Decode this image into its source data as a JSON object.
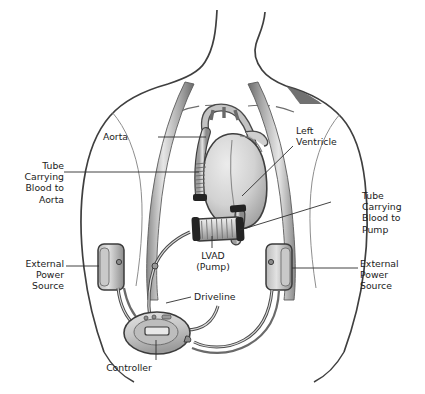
{
  "diagram": {
    "style": "grayscale medical illustration",
    "colors": {
      "background": "#ffffff",
      "outline": "#3a3a3a",
      "text": "#1b1b1b",
      "strap_light": "#e9e9e9",
      "strap_dark": "#6e6e6e",
      "organ_fill": "#d5d5d5",
      "organ_shadow": "#9a9a9a",
      "device_fill": "#cfcfcf",
      "device_band": "#2b2b2b",
      "leader_line": "#2e2e2e"
    },
    "labels": [
      {
        "id": "aorta",
        "text": "Aorta",
        "align": "right",
        "x": 128,
        "y": 131,
        "leader": "horizontal-right"
      },
      {
        "id": "left-ventricle",
        "text": "Left\nVentricle",
        "align": "left",
        "x": 296,
        "y": 131,
        "leader": "diagonal-down-left"
      },
      {
        "id": "tube-to-aorta",
        "text": "Tube\nCarrying\nBlood to\nAorta",
        "align": "right",
        "x": 22,
        "y": 160,
        "leader": "horizontal-right"
      },
      {
        "id": "tube-to-pump",
        "text": "Tube\nCarrying\nBlood to\nPump",
        "align": "left",
        "x": 362,
        "y": 196,
        "leader": "horizontal-left"
      },
      {
        "id": "lvad-pump",
        "text": "LVAD\n(Pump)",
        "align": "center",
        "x": 197,
        "y": 252,
        "leader": "vertical-up"
      },
      {
        "id": "external-power-left",
        "text": "External\nPower\nSource",
        "align": "right",
        "x": 24,
        "y": 262,
        "leader": "horizontal-right"
      },
      {
        "id": "external-power-right",
        "text": "External\nPower\nSource",
        "align": "left",
        "x": 360,
        "y": 262,
        "leader": "horizontal-left"
      },
      {
        "id": "driveline",
        "text": "Driveline",
        "align": "left",
        "x": 194,
        "y": 294,
        "leader": "horizontal-left"
      },
      {
        "id": "controller",
        "text": "Controller",
        "align": "center",
        "x": 128,
        "y": 364,
        "leader": "vertical-up"
      }
    ],
    "components": [
      {
        "id": "torso",
        "name": "patient torso outline",
        "interactable": false
      },
      {
        "id": "neck",
        "name": "neck outline",
        "interactable": false
      },
      {
        "id": "shoulder-strap-left",
        "name": "shoulder strap carrying battery",
        "interactable": false
      },
      {
        "id": "shoulder-strap-right",
        "name": "shoulder strap carrying battery",
        "interactable": false
      },
      {
        "id": "heart",
        "name": "heart",
        "interactable": false
      },
      {
        "id": "aorta-vessel",
        "name": "aortic arch",
        "interactable": false
      },
      {
        "id": "outflow-graft",
        "name": "ribbed outflow graft to aorta",
        "interactable": false
      },
      {
        "id": "inflow-cannula",
        "name": "inflow cannula from left ventricle",
        "interactable": false
      },
      {
        "id": "pump-body",
        "name": "LVAD pump cylinder",
        "interactable": false
      },
      {
        "id": "driveline-cable",
        "name": "percutaneous driveline cable",
        "interactable": false
      },
      {
        "id": "battery-left",
        "name": "external battery pack",
        "interactable": false
      },
      {
        "id": "battery-right",
        "name": "external battery pack",
        "interactable": false
      },
      {
        "id": "controller-unit",
        "name": "system controller",
        "interactable": false
      },
      {
        "id": "controller-display",
        "name": "controller display screen",
        "interactable": false
      },
      {
        "id": "controller-buttons",
        "name": "controller indicator buttons",
        "interactable": false
      }
    ]
  }
}
